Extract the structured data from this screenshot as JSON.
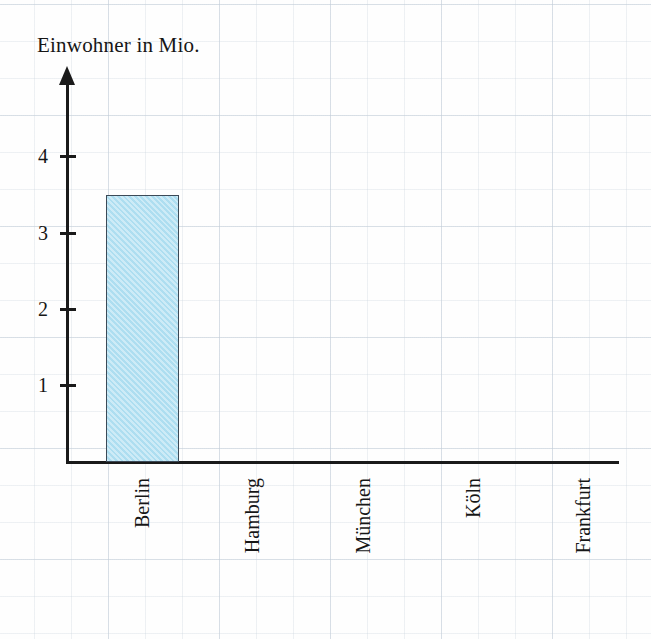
{
  "chart_data": {
    "type": "bar",
    "title": "Einwohner in Mio.",
    "xlabel": "",
    "ylabel": "Einwohner in Mio.",
    "categories": [
      "Berlin",
      "Hamburg",
      "München",
      "Köln",
      "Frankfurt"
    ],
    "values": [
      3.5,
      0,
      0,
      0,
      0
    ],
    "yticks": [
      1,
      2,
      3,
      4
    ],
    "ylim": [
      0,
      4.9
    ],
    "grid": true,
    "legend": null
  },
  "axis": {
    "y_tick_labels": [
      "4",
      "3",
      "2",
      "1"
    ],
    "category_labels": [
      "Berlin",
      "Hamburg",
      "München",
      "Köln",
      "Frankfurt"
    ]
  },
  "style": {
    "bar_fill": "#b2e0f2",
    "bar_stroke": "#3c4a57",
    "axis_color": "#1a1a1a",
    "grid_color": "#b9c6d4",
    "text_color": "#161616",
    "background": "#fefefe"
  }
}
